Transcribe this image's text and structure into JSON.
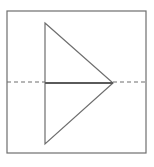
{
  "diagram": {
    "colors": {
      "stroke": "#6e6e6e",
      "axis": "#5a5a5a",
      "background": "#ffffff"
    },
    "frame": {
      "x": 7,
      "y": 11,
      "width": 139,
      "height": 142
    },
    "triangle": {
      "points": [
        [
          45,
          23
        ],
        [
          113,
          83
        ],
        [
          45,
          144
        ]
      ]
    },
    "axis_solid": {
      "x1": 45,
      "y1": 83,
      "x2": 113,
      "y2": 83
    },
    "axis_dashed_left": {
      "x1": 7,
      "y1": 82,
      "x2": 45,
      "y2": 82
    },
    "axis_dashed_right": {
      "x1": 113,
      "y1": 82,
      "x2": 146,
      "y2": 82
    }
  }
}
